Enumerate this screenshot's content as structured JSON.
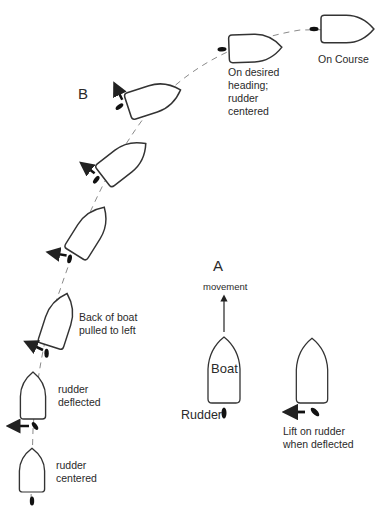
{
  "diagram": {
    "section_labels": {
      "a": "A",
      "b": "B"
    },
    "panel_a": {
      "movement_label": "movement",
      "boat_label": "Boat",
      "rudder_label": "Rudder",
      "lift_label": "Lift on rudder\nwhen deflected"
    },
    "panel_b": {
      "steps": [
        {
          "label": "rudder\ncentered",
          "rudder": "centered"
        },
        {
          "label": "rudder\ndeflected",
          "rudder": "deflected",
          "force_arrow": "left"
        },
        {
          "label": "Back of boat\npulled to left",
          "force_arrow": "left"
        },
        {
          "label": "",
          "force_arrow": "left"
        },
        {
          "label": "",
          "force_arrow": "up-left"
        },
        {
          "label": "",
          "force_arrow": "up"
        },
        {
          "label": "On desired\nheading;\nrudder\ncentered",
          "rudder": "centered"
        },
        {
          "label": "On Course",
          "rudder": "centered"
        }
      ]
    },
    "colors": {
      "line": "#333333",
      "dashed_path": "#888888",
      "text": "#2a2a2a",
      "background": "#ffffff"
    }
  }
}
